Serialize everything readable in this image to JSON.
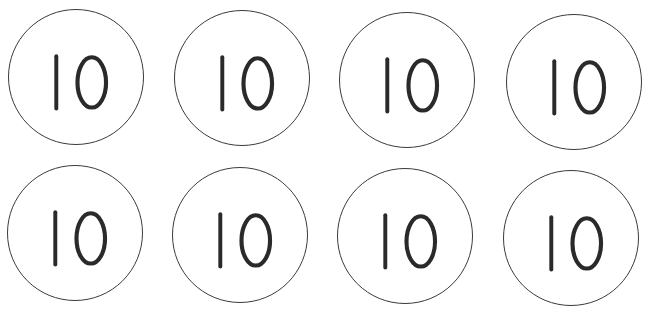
{
  "coins": [
    {
      "value": "10",
      "x": 8,
      "y": 9
    },
    {
      "value": "10",
      "x": 174,
      "y": 10
    },
    {
      "value": "10",
      "x": 339,
      "y": 12
    },
    {
      "value": "10",
      "x": 506,
      "y": 14
    },
    {
      "value": "10",
      "x": 7,
      "y": 165
    },
    {
      "value": "10",
      "x": 172,
      "y": 167
    },
    {
      "value": "10",
      "x": 337,
      "y": 168
    },
    {
      "value": "10",
      "x": 503,
      "y": 170
    }
  ],
  "style": {
    "stroke": "#2a2a2a",
    "border": "#3a3a3a",
    "background": "#ffffff"
  }
}
